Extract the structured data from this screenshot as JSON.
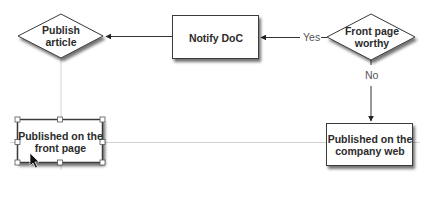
{
  "diagram": {
    "type": "flowchart",
    "nodes": [
      {
        "id": "publish_article",
        "shape": "diamond",
        "label": "Publish\narticle",
        "label_lines": [
          "Publish",
          "article"
        ]
      },
      {
        "id": "notify_doc",
        "shape": "rectangle",
        "label": "Notify DoC"
      },
      {
        "id": "front_page_worthy",
        "shape": "diamond",
        "label": "Front page\nworthy",
        "label_lines": [
          "Front page",
          "worthy"
        ]
      },
      {
        "id": "published_front_page",
        "shape": "rectangle",
        "label": "Published on the\nfront page",
        "label_lines": [
          "Published on the",
          "front page"
        ],
        "selected": true
      },
      {
        "id": "published_company_web",
        "shape": "rectangle",
        "label": "Published on the\ncompany web",
        "label_lines": [
          "Published on the",
          "company web"
        ]
      }
    ],
    "edges": [
      {
        "from": "notify_doc",
        "to": "publish_article",
        "label": ""
      },
      {
        "from": "front_page_worthy",
        "to": "notify_doc",
        "label": "Yes"
      },
      {
        "from": "front_page_worthy",
        "to": "published_company_web",
        "label": "No"
      }
    ],
    "labels": {
      "yes": "Yes",
      "no": "No"
    },
    "colors": {
      "stroke": "#3a3a3a",
      "shadow": "#9a9a9a",
      "guide": "#cfcfcf",
      "fill": "#ffffff",
      "text": "#2b2b2b"
    }
  }
}
